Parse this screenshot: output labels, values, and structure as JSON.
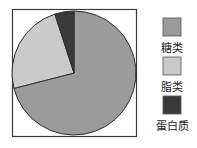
{
  "chart_data": {
    "type": "pie",
    "title": "",
    "categories": [
      "糖类",
      "脂类",
      "蛋白质"
    ],
    "values": [
      71,
      24,
      5
    ],
    "unit": "%",
    "start_angle_deg": 0,
    "direction": "clockwise from 12 o'clock: 糖类, 脂类, 蛋白质",
    "colors": [
      "#9b9b9b",
      "#cacaca",
      "#3a3a3a"
    ],
    "legend": {
      "position": "right",
      "entries": [
        {
          "label": "糖类",
          "color": "#9b9b9b"
        },
        {
          "label": "脂类",
          "color": "#cacaca"
        },
        {
          "label": "蛋白质",
          "color": "#3a3a3a"
        }
      ]
    },
    "frame": true
  }
}
